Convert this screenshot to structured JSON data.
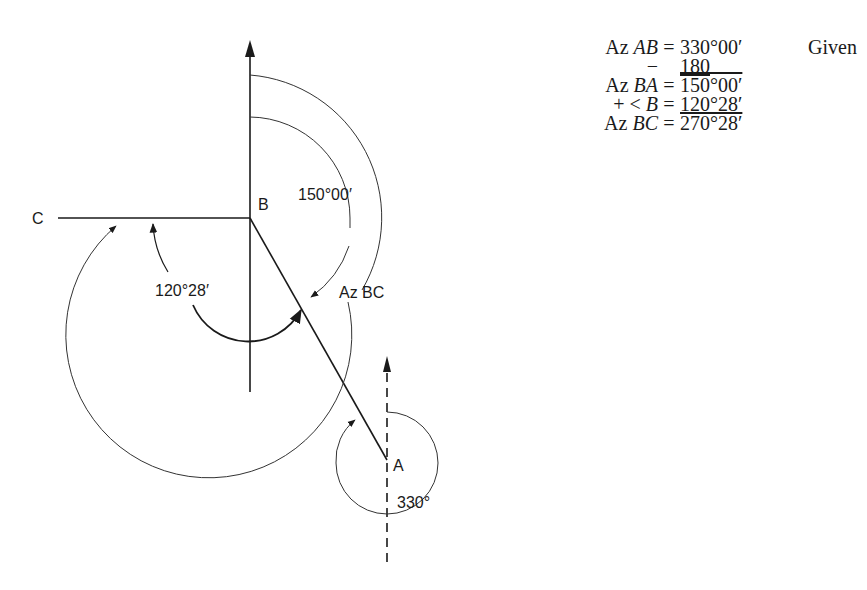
{
  "diagram": {
    "labels": {
      "C": "C",
      "B": "B",
      "A": "A"
    },
    "angle_labels": {
      "az_ba": "150°00′",
      "angle_b": "120°28′",
      "az_bc": "Az BC",
      "az_ab": "330°"
    }
  },
  "calculation": {
    "rows": [
      {
        "lhs_prefix": "Az ",
        "lhs_var": "AB",
        "eq": "=",
        "value": "330°00′",
        "note": "Given"
      },
      {
        "lhs_prefix": "− ",
        "lhs_var": "",
        "eq": "",
        "value": "180",
        "note": ""
      },
      {
        "lhs_prefix": "Az ",
        "lhs_var": "BA",
        "eq": "=",
        "value": "150°00′",
        "note": ""
      },
      {
        "lhs_prefix": "+ < ",
        "lhs_var": "B",
        "eq": "=",
        "value": "120°28′",
        "note": ""
      },
      {
        "lhs_prefix": "Az ",
        "lhs_var": "BC",
        "eq": "=",
        "value": "270°28′",
        "note": ""
      }
    ]
  }
}
